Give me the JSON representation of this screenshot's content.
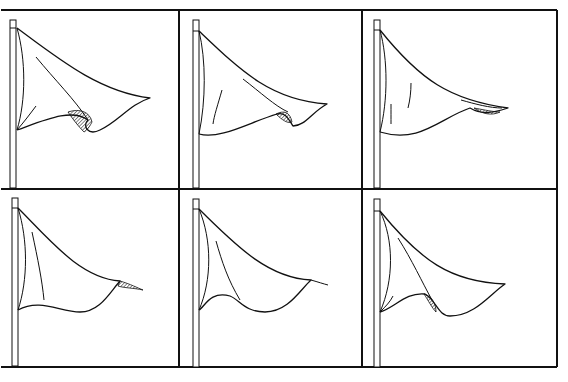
{
  "figure": {
    "title": "Six stages of a triangular pennant flag waving",
    "layout": {
      "rows": 2,
      "cols": 3
    },
    "line_color": "#111111",
    "background": "#ffffff",
    "grid": {
      "x": [
        1,
        179,
        362,
        557
      ],
      "y": [
        10,
        189,
        367
      ]
    },
    "panels": [
      {
        "id": "panel-1",
        "label": "Flag frame 1",
        "pole": {
          "x": 10,
          "y": 20,
          "w": 6,
          "h": 168,
          "collar_y": 28
        },
        "outline": "M17,28 C60,60 100,92 150,98 C130,104 118,122 100,130 C88,136 82,126 88,120 C72,108 45,120 17,130",
        "inner": [
          "M17,28 C26,60 26,100 17,130",
          "M36,57 C55,80 75,100 88,120",
          "M17,130 C24,122 30,114 36,106"
        ],
        "shade": "M68,112 C80,108 90,112 92,122 C88,130 84,132 84,132 C78,126 72,118 68,112 Z"
      },
      {
        "id": "panel-2",
        "label": "Flag frame 2",
        "pole": {
          "x": 193,
          "y": 20,
          "w": 6,
          "h": 168,
          "collar_y": 31
        },
        "outline": "M199,31 C240,70 270,100 327,104 C312,112 305,126 293,126 C288,118 285,112 277,114 C250,122 220,140 199,134",
        "inner": [
          "M199,31 C206,60 206,100 199,134",
          "M243,79 C260,92 275,106 288,112",
          "M222,90 C218,104 214,116 213,124"
        ],
        "shade": "M276,114 C284,110 290,112 292,122 C288,124 282,120 276,114 Z"
      },
      {
        "id": "panel-3",
        "label": "Flag frame 3",
        "pole": {
          "x": 374,
          "y": 20,
          "w": 6,
          "h": 168,
          "collar_y": 30
        },
        "outline": "M380,30 C420,80 450,100 508,108 C490,114 480,114 470,108 C440,118 420,144 380,132",
        "inner": [
          "M380,30 C388,60 388,100 380,132",
          "M461,100 C475,104 490,108 502,108",
          "M411,83 C411,92 410,100 408,108",
          "M391,104 C391,112 391,118 391,124"
        ],
        "shade": "M474,108 C485,110 494,112 500,112 C492,116 482,114 474,108 Z"
      },
      {
        "id": "panel-4",
        "label": "Flag frame 4",
        "pole": {
          "x": 12,
          "y": 198,
          "w": 6,
          "h": 168,
          "collar_y": 208
        },
        "outline": "M18,208 C50,240 80,278 120,281 C110,292 100,312 80,312 C60,312 40,298 18,310",
        "inner": [
          "M18,208 C28,240 28,280 18,310",
          "M32,232 C38,260 42,280 44,300"
        ],
        "shade": "M120,281 C130,284 138,288 143,290 C134,288 124,288 118,286 Z"
      },
      {
        "id": "panel-5",
        "label": "Flag frame 5",
        "pole": {
          "x": 193,
          "y": 199,
          "w": 6,
          "h": 168,
          "collar_y": 209
        },
        "outline": "M199,209 C240,250 270,278 311,280 C300,290 288,312 265,312 C245,312 240,300 230,296 C210,290 204,308 199,310",
        "inner": [
          "M199,209 C212,240 212,280 199,310",
          "M216,241 C222,262 228,280 240,300",
          "M311,280 C318,282 324,284 328,285"
        ]
      },
      {
        "id": "panel-6",
        "label": "Flag frame 6",
        "pole": {
          "x": 374,
          "y": 199,
          "w": 6,
          "h": 168,
          "collar_y": 211
        },
        "outline": "M380,211 C420,260 450,282 505,284 C490,294 475,316 450,316 C438,316 436,300 425,294 C405,292 395,308 380,312",
        "inner": [
          "M380,211 C394,240 394,280 380,312",
          "M398,238 C412,260 422,282 432,300",
          "M380,312 C386,306 390,302 393,296"
        ],
        "shade": "M424,294 C432,296 436,304 436,312 C432,308 428,300 424,294 Z"
      }
    ]
  }
}
